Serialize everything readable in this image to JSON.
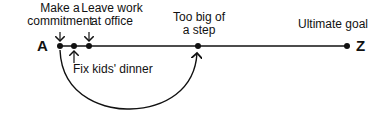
{
  "diagram": {
    "start_label": "A",
    "end_label": "Z",
    "steps": [
      {
        "label": "Make a commitment",
        "line1": "Make a",
        "line2": "commitment"
      },
      {
        "label": "Fix kids' dinner"
      },
      {
        "label": "Leave work at office",
        "line1": "Leave work",
        "line2": "at office"
      },
      {
        "label": "Too big of a step",
        "line1": "Too big of",
        "line2": "a step"
      }
    ],
    "goal_label": "Ultimate goal"
  }
}
